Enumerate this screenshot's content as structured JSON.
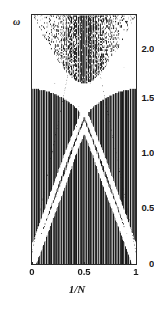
{
  "figure": {
    "background": "#ffffff",
    "frame_color": "#2b2b2b",
    "data_color": "#1a1a1a"
  },
  "chart_data": {
    "type": "scatter",
    "title": "",
    "subtitle": "",
    "xlabel": "1/N",
    "ylabel": "ω",
    "xlim": [
      0,
      1
    ],
    "ylim": [
      0,
      2.2
    ],
    "grid": false,
    "legend": null,
    "xticks": [
      0,
      0.5,
      1
    ],
    "xticklabels": [
      "0",
      "0.5",
      "1"
    ],
    "yticks": [
      0,
      0.5,
      1.0,
      1.5,
      2.0
    ],
    "yticklabels": [
      "0",
      "0.5",
      "1.0",
      "1.5",
      "2.0"
    ],
    "series": [
      {
        "name": "upper band lower edge",
        "comment": "Parabolic boundary of the separated top band; minimum at centre.",
        "x": [
          0.0,
          0.05,
          0.1,
          0.15,
          0.2,
          0.25,
          0.3,
          0.35,
          0.4,
          0.45,
          0.5,
          0.55,
          0.6,
          0.65,
          0.7,
          0.75,
          0.8,
          0.85,
          0.9,
          0.95,
          1.0
        ],
        "values": [
          2.2,
          2.11,
          2.02,
          1.94,
          1.86,
          1.79,
          1.72,
          1.67,
          1.63,
          1.6,
          1.59,
          1.6,
          1.63,
          1.67,
          1.72,
          1.79,
          1.86,
          1.94,
          2.02,
          2.11,
          2.2
        ]
      },
      {
        "name": "upper band top edge",
        "comment": "Top of the spectrum, clipped by the axis limit.",
        "x": [
          0.0,
          0.25,
          0.5,
          0.75,
          1.0
        ],
        "values": [
          2.2,
          2.2,
          2.2,
          2.2,
          2.2
        ]
      },
      {
        "name": "X gap branch rising",
        "comment": "White gap running from lower-left to upper-right through the crossing.",
        "x": [
          0.0,
          0.1,
          0.2,
          0.3,
          0.4,
          0.5,
          0.6,
          0.7,
          0.8,
          0.9,
          1.0
        ],
        "values": [
          0.1,
          0.36,
          0.62,
          0.88,
          1.12,
          1.35,
          1.45,
          1.52,
          1.57,
          1.6,
          1.62
        ]
      },
      {
        "name": "X gap branch falling",
        "comment": "Mirror image of the rising gap branch.",
        "x": [
          0.0,
          0.1,
          0.2,
          0.3,
          0.4,
          0.5,
          0.6,
          0.7,
          0.8,
          0.9,
          1.0
        ],
        "values": [
          1.62,
          1.6,
          1.57,
          1.52,
          1.45,
          1.35,
          1.12,
          0.88,
          0.62,
          0.36,
          0.1
        ]
      },
      {
        "name": "lower inverted-V gap left",
        "comment": "White wedge in the lower half rising to an apex at the centre.",
        "x": [
          0.02,
          0.12,
          0.22,
          0.32,
          0.42,
          0.5
        ],
        "values": [
          0.02,
          0.26,
          0.51,
          0.75,
          1.02,
          1.2
        ]
      },
      {
        "name": "lower inverted-V gap right",
        "comment": "Mirror image of the lower white wedge.",
        "x": [
          0.5,
          0.58,
          0.68,
          0.78,
          0.88,
          0.98
        ],
        "values": [
          1.2,
          1.02,
          0.75,
          0.51,
          0.26,
          0.02
        ]
      }
    ]
  },
  "axes": {
    "y": {
      "title": "ω",
      "ticks": [
        {
          "label": "0",
          "value": 0.0
        },
        {
          "label": "0.5",
          "value": 0.5
        },
        {
          "label": "1.0",
          "value": 1.0
        },
        {
          "label": "1.5",
          "value": 1.5
        },
        {
          "label": "2.0",
          "value": 2.0
        }
      ]
    },
    "x": {
      "title": "1/N",
      "ticks": [
        {
          "label": "0",
          "value": 0.0
        },
        {
          "label": "0.5",
          "value": 0.5
        },
        {
          "label": "1",
          "value": 1.0
        }
      ]
    }
  }
}
